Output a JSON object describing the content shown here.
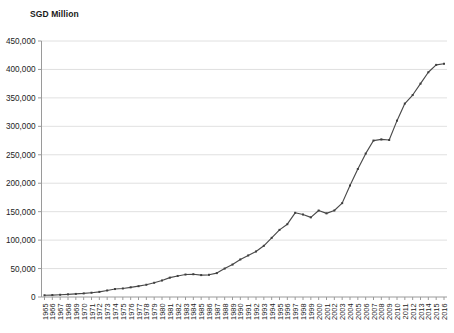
{
  "chart_data": {
    "type": "line",
    "title": "",
    "subtitle": "",
    "ylabel": "SGD Million",
    "xlabel": "",
    "ylim": [
      0,
      450000
    ],
    "ytick_step": 50000,
    "grid": true,
    "legend": null,
    "marker": "square",
    "line_color": "#4a4a4a",
    "ytick_labels": [
      "450,000",
      "400,000",
      "350,000",
      "300,000",
      "250,000",
      "200,000",
      "150,000",
      "100,000",
      "50,000",
      "0"
    ],
    "ytick_values": [
      450000,
      400000,
      350000,
      300000,
      250000,
      200000,
      150000,
      100000,
      50000,
      0
    ],
    "categories": [
      "1965",
      "1966",
      "1967",
      "1968",
      "1969",
      "1970",
      "1971",
      "1972",
      "1973",
      "1974",
      "1975",
      "1976",
      "1977",
      "1978",
      "1979",
      "1980",
      "1981",
      "1982",
      "1983",
      "1984",
      "1985",
      "1986",
      "1987",
      "1988",
      "1989",
      "1990",
      "1991",
      "1992",
      "1993",
      "1994",
      "1995",
      "1996",
      "1997",
      "1998",
      "1999",
      "2000",
      "2001",
      "2002",
      "2003",
      "2004",
      "2005",
      "2006",
      "2007",
      "2008",
      "2009",
      "2010",
      "2011",
      "2012",
      "2013",
      "2014",
      "2015",
      "2016"
    ],
    "values": [
      3000,
      3400,
      3900,
      4600,
      5400,
      6300,
      7500,
      9000,
      11500,
      14000,
      15000,
      17000,
      19000,
      21500,
      25000,
      29000,
      34000,
      37000,
      39500,
      40000,
      38500,
      39000,
      42000,
      50000,
      57000,
      66000,
      73000,
      80000,
      90000,
      104000,
      118000,
      128000,
      148000,
      145000,
      140000,
      152000,
      147000,
      152000,
      165000,
      196000,
      225000,
      252000,
      275000,
      277000,
      276000,
      310000,
      340000,
      355000,
      375000,
      395000,
      408000,
      410000
    ]
  }
}
